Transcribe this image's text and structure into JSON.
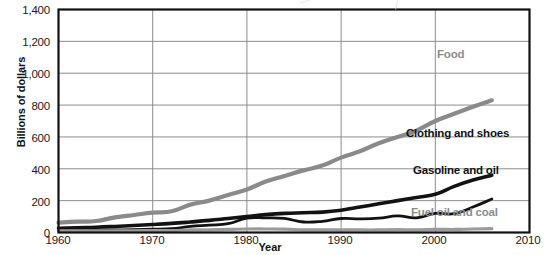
{
  "chart_data": {
    "type": "line",
    "title": "",
    "xlabel": "Year",
    "ylabel": "Billions of dollars",
    "xlim": [
      1960,
      2010
    ],
    "ylim": [
      0,
      1400
    ],
    "xticks": [
      "1960",
      "1970",
      "1980",
      "1990",
      "2000",
      "2010"
    ],
    "yticks": [
      "0",
      "200",
      "400",
      "600",
      "800",
      "1,000",
      "1,200",
      "1,400"
    ],
    "grid": true,
    "legend_position": "inline-annotations",
    "x": [
      1960,
      1962,
      1964,
      1966,
      1968,
      1970,
      1972,
      1974,
      1976,
      1978,
      1980,
      1982,
      1984,
      1986,
      1988,
      1990,
      1992,
      1994,
      1996,
      1998,
      2000,
      2002,
      2004,
      2006
    ],
    "series": [
      {
        "name": "Food",
        "color": "#8a8a8a",
        "width": 4.2,
        "values": [
          62,
          68,
          72,
          95,
          110,
          125,
          133,
          175,
          200,
          235,
          270,
          320,
          355,
          390,
          420,
          470,
          510,
          560,
          600,
          640,
          700,
          745,
          790,
          830
        ]
      },
      {
        "name": "Clothing and shoes",
        "color": "#121212",
        "width": 3.6,
        "values": [
          26,
          30,
          33,
          38,
          44,
          50,
          57,
          66,
          76,
          88,
          100,
          112,
          120,
          124,
          128,
          140,
          160,
          180,
          200,
          220,
          240,
          290,
          330,
          360
        ]
      },
      {
        "name": "Gasoline and oil",
        "color": "#121212",
        "width": 2.8,
        "values": [
          12,
          13,
          14,
          16,
          18,
          21,
          24,
          38,
          46,
          55,
          90,
          92,
          88,
          66,
          70,
          88,
          86,
          90,
          104,
          92,
          120,
          118,
          160,
          210
        ]
      },
      {
        "name": "Fuel oil and coal",
        "color": "#9a9a9a",
        "width": 3.2,
        "values": [
          10,
          10,
          10,
          11,
          11,
          12,
          12,
          16,
          17,
          19,
          22,
          22,
          21,
          17,
          16,
          17,
          16,
          16,
          18,
          16,
          20,
          19,
          22,
          24
        ]
      }
    ],
    "annotations": [
      {
        "text": "Food",
        "series": "Food"
      },
      {
        "text": "Clothing and shoes",
        "series": "Clothing and shoes"
      },
      {
        "text": "Gasoline and oil",
        "series": "Gasoline and oil"
      },
      {
        "text": "Fuel oil and coal",
        "series": "Fuel oil and coal"
      }
    ]
  },
  "axes": {
    "ylabel": "Billions of dollars",
    "xlabel": "Year",
    "yticks": [
      "1,400",
      "1,200",
      "1,000",
      "800",
      "600",
      "400",
      "200",
      "0"
    ],
    "xticks": [
      "1960",
      "1970",
      "1980",
      "1990",
      "2000",
      "2010"
    ]
  },
  "labels": {
    "food": "Food",
    "clothing": "Clothing and shoes",
    "gasoline": "Gasoline and oil",
    "fueloil": "Fuel oil and coal"
  }
}
